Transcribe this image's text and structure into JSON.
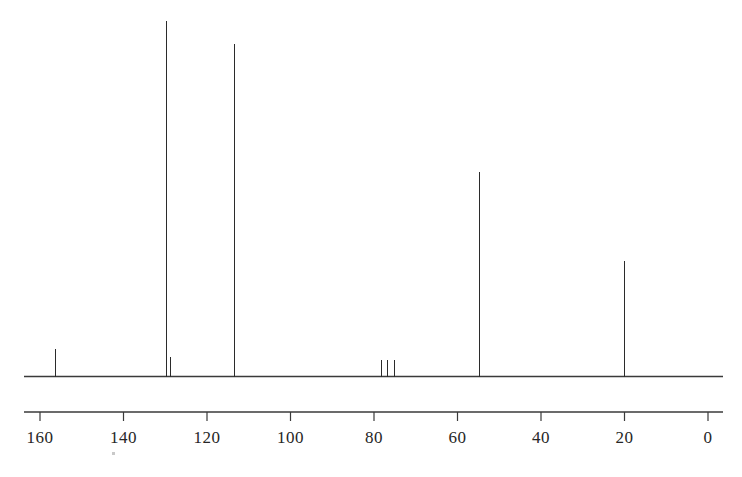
{
  "chart_data": {
    "type": "bar",
    "title": "",
    "subtitle": "",
    "xlabel": "",
    "ylabel": "",
    "nucleus": "13C",
    "axis_units": "ppm",
    "xlim": [
      170,
      -5
    ],
    "x_axis_reversed": true,
    "ylim": [
      0,
      100
    ],
    "grid": false,
    "legend": false,
    "tick_labels": [
      "160",
      "140",
      "120",
      "100",
      "80",
      "60",
      "40",
      "20",
      "0"
    ],
    "tick_values": [
      160,
      140,
      120,
      100,
      80,
      60,
      40,
      20,
      0
    ],
    "tick_interval": 20,
    "baseline_value": 0,
    "x": [
      156.3,
      129.8,
      128.8,
      113.5,
      78.3,
      76.7,
      75.1,
      54.7,
      20.1
    ],
    "values": [
      7.6,
      100.0,
      5.5,
      93.4,
      4.7,
      4.7,
      4.7,
      57.5,
      32.6
    ],
    "peaks": [
      {
        "ppm": 156.3,
        "intensity": 7.6,
        "label": ""
      },
      {
        "ppm": 129.8,
        "intensity": 100.0,
        "label": ""
      },
      {
        "ppm": 128.8,
        "intensity": 5.5,
        "label": ""
      },
      {
        "ppm": 113.5,
        "intensity": 93.4,
        "label": ""
      },
      {
        "ppm": 78.3,
        "intensity": 4.7,
        "label": ""
      },
      {
        "ppm": 76.7,
        "intensity": 4.7,
        "label": ""
      },
      {
        "ppm": 75.1,
        "intensity": 4.7,
        "label": ""
      },
      {
        "ppm": 54.7,
        "intensity": 57.5,
        "label": ""
      },
      {
        "ppm": 20.1,
        "intensity": 32.6,
        "label": ""
      }
    ],
    "colors": {
      "trace": "#2b2b2b",
      "axis": "#3a3a3a",
      "background": "#ffffff",
      "tick_label": "#262626"
    }
  }
}
